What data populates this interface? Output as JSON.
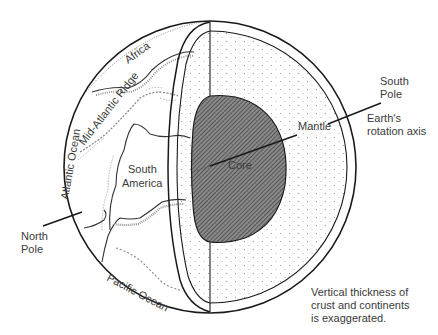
{
  "diagram": {
    "type": "earth-cross-section",
    "labels": {
      "africa": "Africa",
      "mid_atlantic_ridge": "Mid-Atlantic Ridge",
      "atlantic_ocean": "Atlantic Ocean",
      "south_america_line1": "South",
      "south_america_line2": "America",
      "pacific_ocean": "Pacific Ocean",
      "north_pole_line1": "North",
      "north_pole_line2": "Pole",
      "south_pole_line1": "South",
      "south_pole_line2": "Pole",
      "mantle": "Mantle",
      "core": "Core",
      "axis_line1": "Earth's",
      "axis_line2": "rotation axis"
    },
    "note": {
      "line1": "Vertical thickness of",
      "line2": "crust and continents",
      "line3": "is exaggerated."
    },
    "colors": {
      "background": "#ffffff",
      "line": "#1a1a1a",
      "core_fill": "#6e6e6e",
      "mantle_dots": "#9a9a9a",
      "text": "#3a3a3a"
    }
  }
}
